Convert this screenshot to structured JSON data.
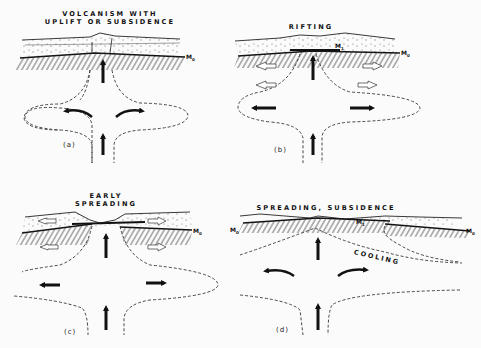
{
  "figure": {
    "background": "#fbfbfb",
    "ink_color": "#111111",
    "panels": [
      {
        "id": "a",
        "label": "(a)",
        "title_lines": [
          "VOLCANISM WITH",
          "UPLIFT OR SUBSIDENCE"
        ],
        "moho_labels": [
          {
            "text": "M",
            "sub": "0"
          }
        ],
        "arrows": [
          "upward mantle flow",
          "lateral curved outflow left",
          "lateral curved outflow right",
          "upward feeder arrow"
        ]
      },
      {
        "id": "b",
        "label": "(b)",
        "title_lines": [
          "RIFTING"
        ],
        "moho_labels": [
          {
            "text": "M",
            "sub": "1"
          },
          {
            "text": "M",
            "sub": "0"
          }
        ],
        "arrows": [
          "upward mantle flow",
          "open extension arrows left/right",
          "solid outflow arrows left/right"
        ]
      },
      {
        "id": "c",
        "label": "(c)",
        "title_lines": [
          "EARLY",
          "SPREADING"
        ],
        "moho_labels": [
          {
            "text": "M",
            "sub": "0"
          }
        ],
        "arrows": [
          "upward mantle flow",
          "open extension arrows left/right",
          "solid outflow arrows left/right"
        ]
      },
      {
        "id": "d",
        "label": "(d)",
        "title_lines": [
          "SPREADING, SUBSIDENCE"
        ],
        "moho_labels": [
          {
            "text": "M",
            "sub": "0"
          },
          {
            "text": "M",
            "sub": "1"
          },
          {
            "text": "M",
            "sub": "0"
          }
        ],
        "annotation": "COOLING",
        "arrows": [
          "upward mantle flow",
          "lateral curved outflow left",
          "lateral curved outflow right"
        ]
      }
    ]
  }
}
